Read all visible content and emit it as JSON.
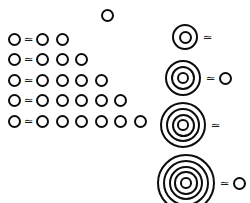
{
  "figure": {
    "background_color": "#ffffff",
    "stroke_color": "#0d0d0d",
    "relation_symbol": "≃",
    "circle_glyph_name": "open-circle"
  },
  "lone_circle": {
    "name": "isolated-circle",
    "count": 1
  },
  "left_rows": [
    {
      "left_count": 1,
      "symbol": "≃",
      "right_count": 2
    },
    {
      "left_count": 1,
      "symbol": "≃",
      "right_count": 3
    },
    {
      "left_count": 1,
      "symbol": "≃",
      "right_count": 4
    },
    {
      "left_count": 1,
      "symbol": "≃",
      "right_count": 5
    },
    {
      "left_count": 1,
      "symbol": "≃",
      "right_count": 6
    }
  ],
  "right_groups": [
    {
      "rings": 2,
      "symbol": "≃",
      "trailing_circles": 0,
      "outer_diameter": 26
    },
    {
      "rings": 3,
      "symbol": "≃",
      "trailing_circles": 1,
      "outer_diameter": 36
    },
    {
      "rings": 4,
      "symbol": "≃",
      "trailing_circles": 0,
      "outer_diameter": 46
    },
    {
      "rings": 5,
      "symbol": "≃",
      "trailing_circles": 1,
      "outer_diameter": 58
    }
  ]
}
